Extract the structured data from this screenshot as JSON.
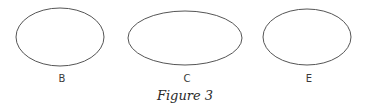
{
  "figure": {
    "caption": "Figure 3",
    "stroke_color": "#555555",
    "shapes": [
      {
        "label": "B",
        "type": "ellipse",
        "cx": 60,
        "cy": 37,
        "rx": 44,
        "ry": 29
      },
      {
        "label": "C",
        "type": "ellipse",
        "cx": 185,
        "cy": 38,
        "rx": 57,
        "ry": 27
      },
      {
        "label": "E",
        "type": "ellipse",
        "cx": 307,
        "cy": 37,
        "rx": 44,
        "ry": 28
      }
    ]
  }
}
